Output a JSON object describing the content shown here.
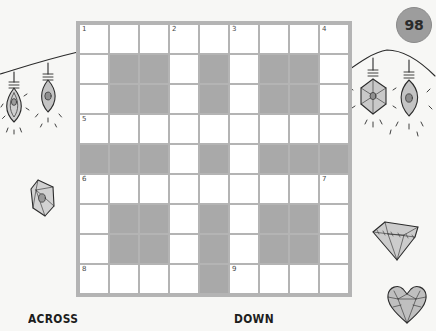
{
  "page": {
    "number": "98",
    "background_color": "#f7f7f5",
    "accent_gray": "#a9a9a9",
    "grid_border_color": "#b4b4b4"
  },
  "puzzle": {
    "type": "crossword",
    "columns": 9,
    "rows": 9,
    "rows_data": [
      {
        "index": 1,
        "cells": [
          {
            "block": false,
            "number": "1"
          },
          {
            "block": false,
            "number": ""
          },
          {
            "block": false,
            "number": ""
          },
          {
            "block": false,
            "number": "2"
          },
          {
            "block": false,
            "number": ""
          },
          {
            "block": false,
            "number": "3"
          },
          {
            "block": false,
            "number": ""
          },
          {
            "block": false,
            "number": ""
          },
          {
            "block": false,
            "number": "4"
          }
        ]
      },
      {
        "index": 2,
        "cells": [
          {
            "block": false,
            "number": ""
          },
          {
            "block": true,
            "number": ""
          },
          {
            "block": true,
            "number": ""
          },
          {
            "block": false,
            "number": ""
          },
          {
            "block": true,
            "number": ""
          },
          {
            "block": false,
            "number": ""
          },
          {
            "block": true,
            "number": ""
          },
          {
            "block": true,
            "number": ""
          },
          {
            "block": false,
            "number": ""
          }
        ]
      },
      {
        "index": 3,
        "cells": [
          {
            "block": false,
            "number": ""
          },
          {
            "block": true,
            "number": ""
          },
          {
            "block": true,
            "number": ""
          },
          {
            "block": false,
            "number": ""
          },
          {
            "block": true,
            "number": ""
          },
          {
            "block": false,
            "number": ""
          },
          {
            "block": true,
            "number": ""
          },
          {
            "block": true,
            "number": ""
          },
          {
            "block": false,
            "number": ""
          }
        ]
      },
      {
        "index": 4,
        "cells": [
          {
            "block": false,
            "number": "5"
          },
          {
            "block": false,
            "number": ""
          },
          {
            "block": false,
            "number": ""
          },
          {
            "block": false,
            "number": ""
          },
          {
            "block": false,
            "number": ""
          },
          {
            "block": false,
            "number": ""
          },
          {
            "block": false,
            "number": ""
          },
          {
            "block": false,
            "number": ""
          },
          {
            "block": false,
            "number": ""
          }
        ]
      },
      {
        "index": 5,
        "cells": [
          {
            "block": true,
            "number": ""
          },
          {
            "block": true,
            "number": ""
          },
          {
            "block": true,
            "number": ""
          },
          {
            "block": false,
            "number": ""
          },
          {
            "block": true,
            "number": ""
          },
          {
            "block": false,
            "number": ""
          },
          {
            "block": true,
            "number": ""
          },
          {
            "block": true,
            "number": ""
          },
          {
            "block": true,
            "number": ""
          }
        ]
      },
      {
        "index": 6,
        "cells": [
          {
            "block": false,
            "number": "6"
          },
          {
            "block": false,
            "number": ""
          },
          {
            "block": false,
            "number": ""
          },
          {
            "block": false,
            "number": ""
          },
          {
            "block": false,
            "number": ""
          },
          {
            "block": false,
            "number": ""
          },
          {
            "block": false,
            "number": ""
          },
          {
            "block": false,
            "number": ""
          },
          {
            "block": false,
            "number": "7"
          }
        ]
      },
      {
        "index": 7,
        "cells": [
          {
            "block": false,
            "number": ""
          },
          {
            "block": true,
            "number": ""
          },
          {
            "block": true,
            "number": ""
          },
          {
            "block": false,
            "number": ""
          },
          {
            "block": true,
            "number": ""
          },
          {
            "block": false,
            "number": ""
          },
          {
            "block": true,
            "number": ""
          },
          {
            "block": true,
            "number": ""
          },
          {
            "block": false,
            "number": ""
          }
        ]
      },
      {
        "index": 8,
        "cells": [
          {
            "block": false,
            "number": ""
          },
          {
            "block": true,
            "number": ""
          },
          {
            "block": true,
            "number": ""
          },
          {
            "block": false,
            "number": ""
          },
          {
            "block": true,
            "number": ""
          },
          {
            "block": false,
            "number": ""
          },
          {
            "block": true,
            "number": ""
          },
          {
            "block": true,
            "number": ""
          },
          {
            "block": false,
            "number": ""
          }
        ]
      },
      {
        "index": 9,
        "cells": [
          {
            "block": false,
            "number": "8"
          },
          {
            "block": false,
            "number": ""
          },
          {
            "block": false,
            "number": ""
          },
          {
            "block": false,
            "number": ""
          },
          {
            "block": true,
            "number": ""
          },
          {
            "block": false,
            "number": "9"
          },
          {
            "block": false,
            "number": ""
          },
          {
            "block": false,
            "number": ""
          },
          {
            "block": false,
            "number": ""
          }
        ]
      }
    ]
  },
  "sections": {
    "across_label": "ACROSS",
    "down_label": "DOWN"
  },
  "decorations": [
    {
      "name": "string-lights-left",
      "description": "hanging gem lights on a string"
    },
    {
      "name": "string-lights-right",
      "description": "hanging gem lights on a string"
    },
    {
      "name": "gem-doodle-left",
      "description": "faceted gem stone"
    },
    {
      "name": "diamond-doodle-right",
      "description": "cut diamond"
    },
    {
      "name": "heart-gem-doodle-right",
      "description": "heart shaped gem"
    }
  ]
}
